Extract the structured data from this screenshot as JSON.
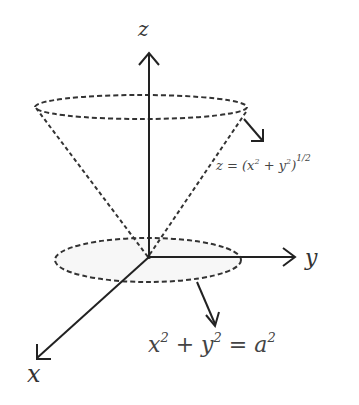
{
  "diagram": {
    "type": "3d-cone-region",
    "axes": {
      "z_label": "z",
      "y_label": "y",
      "x_label": "x"
    },
    "annotations": {
      "cone_equation": {
        "lhs": "z = (x",
        "sup1": "2",
        "mid": " + y",
        "sup2": "2",
        "rhs": ")",
        "exp": "1/2"
      },
      "disk_equation": {
        "t1": "x",
        "s1": "2",
        "t2": " + y",
        "s2": "2",
        "t3": " = a",
        "s3": "2"
      }
    },
    "colors": {
      "line": "#222222",
      "text": "#444444",
      "background": "#ffffff"
    }
  }
}
